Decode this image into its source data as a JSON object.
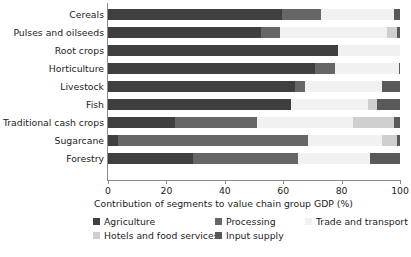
{
  "chart_data": {
    "type": "bar",
    "orientation": "horizontal",
    "stacked": true,
    "normalized": true,
    "title": "",
    "xlabel": "Contribution of segments to value chain group GDP (%)",
    "ylabel": "",
    "xlim": [
      0,
      100
    ],
    "xticks": [
      0,
      20,
      40,
      60,
      80,
      100
    ],
    "xticklabels": [
      "0",
      "20",
      "40",
      "60",
      "80",
      "100"
    ],
    "grid": false,
    "legend_position": "bottom",
    "categories": [
      "Cereals",
      "Pulses and oilseeds",
      "Root crops",
      "Horticulture",
      "Livestock",
      "Fish",
      "Traditional cash crops",
      "Sugarcane",
      "Forestry"
    ],
    "series": [
      {
        "name": "Agriculture",
        "color": "#3f3f3f",
        "values": [
          59.5,
          52.4,
          78.8,
          70.9,
          64.0,
          62.7,
          23.0,
          3.5,
          29.0
        ]
      },
      {
        "name": "Processing",
        "color": "#666666",
        "values": [
          13.5,
          6.6,
          0.0,
          6.8,
          3.5,
          0.0,
          28.0,
          65.0,
          36.0
        ]
      },
      {
        "name": "Trade and transport",
        "color": "#f1f1f1",
        "values": [
          25.0,
          36.5,
          21.2,
          21.8,
          26.3,
          26.3,
          33.0,
          25.5,
          24.7
        ]
      },
      {
        "name": "Hotels and food services",
        "color": "#cfcfcf",
        "values": [
          0.0,
          3.5,
          0.0,
          0.0,
          0.0,
          3.0,
          14.0,
          5.0,
          0.0
        ]
      },
      {
        "name": "Input supply",
        "color": "#595959",
        "values": [
          2.0,
          1.0,
          0.0,
          0.5,
          6.2,
          8.0,
          2.0,
          1.0,
          10.3
        ]
      }
    ]
  },
  "legend": {
    "items": [
      {
        "label": "Agriculture",
        "color": "#3f3f3f"
      },
      {
        "label": "Processing",
        "color": "#666666"
      },
      {
        "label": "Trade and transport",
        "color": "#f1f1f1"
      },
      {
        "label": "Hotels and food services",
        "color": "#cfcfcf"
      },
      {
        "label": "Input supply",
        "color": "#595959"
      }
    ]
  }
}
